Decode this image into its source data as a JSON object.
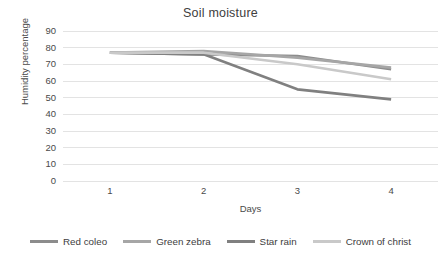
{
  "chart_data": {
    "type": "line",
    "title": "Soil moisture",
    "xlabel": "Days",
    "ylabel": "Humidity percentage",
    "x": [
      1,
      2,
      3,
      4
    ],
    "categories": [
      "1",
      "2",
      "3",
      "4"
    ],
    "xtick_labels": [
      "1",
      "2",
      "3",
      "4"
    ],
    "ytick_labels": [
      "90",
      "80",
      "70",
      "60",
      "50",
      "40",
      "30",
      "20",
      "10",
      "0"
    ],
    "ylim": [
      0,
      90
    ],
    "ytick_step": 10,
    "grid": "horizontal",
    "legend_position": "bottom",
    "series": [
      {
        "name": "Red coleo",
        "values": [
          77,
          76,
          75,
          67
        ],
        "color": "#8c8c8c"
      },
      {
        "name": "Green zebra",
        "values": [
          77,
          78,
          74,
          68
        ],
        "color": "#a6a6a6"
      },
      {
        "name": "Star rain",
        "values": [
          77,
          76,
          55,
          49
        ],
        "color": "#808080"
      },
      {
        "name": "Crown of christ",
        "values": [
          77,
          77,
          70,
          61
        ],
        "color": "#c9c9c9"
      }
    ]
  },
  "legend": {
    "items": [
      {
        "label": "Red coleo"
      },
      {
        "label": "Green zebra"
      },
      {
        "label": "Star rain"
      },
      {
        "label": "Crown of christ"
      }
    ]
  },
  "axes": {
    "y_title": "Humidity percentage",
    "x_title": "Days"
  },
  "colors": {
    "gridline": "#e3e3e3",
    "text": "#404040",
    "background": "#ffffff"
  }
}
